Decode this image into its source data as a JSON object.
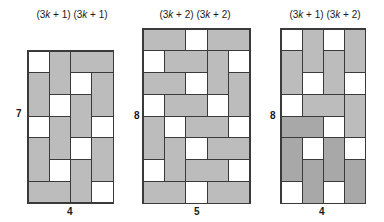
{
  "figures": [
    {
      "id": "fig-a",
      "top_label": "(3k + 1) (3k + 1)",
      "side_label": "7",
      "bottom_label": "4",
      "rows": 7,
      "cols": 4,
      "box": {
        "x": 27,
        "y": 50,
        "w": 87,
        "h": 154
      },
      "label_pos": {
        "top": [
          27,
          9,
          90
        ],
        "side": [
          16,
          108
        ],
        "bottom": [
          67,
          206
        ]
      },
      "tiles": [
        {
          "r": 0,
          "c": 0,
          "rs": 1,
          "cs": 1,
          "fill": "white"
        },
        {
          "r": 0,
          "c": 1,
          "rs": 2,
          "cs": 1,
          "fill": "gray"
        },
        {
          "r": 0,
          "c": 2,
          "rs": 1,
          "cs": 2,
          "fill": "gray"
        },
        {
          "r": 1,
          "c": 0,
          "rs": 2,
          "cs": 1,
          "fill": "gray"
        },
        {
          "r": 1,
          "c": 2,
          "rs": 1,
          "cs": 1,
          "fill": "white"
        },
        {
          "r": 1,
          "c": 3,
          "rs": 2,
          "cs": 1,
          "fill": "gray"
        },
        {
          "r": 2,
          "c": 1,
          "rs": 1,
          "cs": 1,
          "fill": "white"
        },
        {
          "r": 2,
          "c": 2,
          "rs": 2,
          "cs": 1,
          "fill": "gray"
        },
        {
          "r": 3,
          "c": 0,
          "rs": 1,
          "cs": 1,
          "fill": "white"
        },
        {
          "r": 3,
          "c": 1,
          "rs": 2,
          "cs": 1,
          "fill": "gray"
        },
        {
          "r": 3,
          "c": 3,
          "rs": 1,
          "cs": 1,
          "fill": "white"
        },
        {
          "r": 4,
          "c": 0,
          "rs": 2,
          "cs": 1,
          "fill": "gray"
        },
        {
          "r": 4,
          "c": 2,
          "rs": 1,
          "cs": 1,
          "fill": "white"
        },
        {
          "r": 4,
          "c": 3,
          "rs": 2,
          "cs": 1,
          "fill": "gray"
        },
        {
          "r": 5,
          "c": 1,
          "rs": 1,
          "cs": 1,
          "fill": "white"
        },
        {
          "r": 5,
          "c": 2,
          "rs": 2,
          "cs": 1,
          "fill": "gray"
        },
        {
          "r": 6,
          "c": 0,
          "rs": 1,
          "cs": 2,
          "fill": "gray"
        },
        {
          "r": 6,
          "c": 3,
          "rs": 1,
          "cs": 1,
          "fill": "white"
        }
      ]
    },
    {
      "id": "fig-b",
      "top_label": "(3k + 2) (3k + 2)",
      "side_label": "8",
      "bottom_label": "5",
      "rows": 8,
      "cols": 5,
      "box": {
        "x": 142,
        "y": 28,
        "w": 109,
        "h": 176
      },
      "label_pos": {
        "top": [
          150,
          9,
          90
        ],
        "side": [
          134,
          110
        ],
        "bottom": [
          194,
          206
        ]
      },
      "tiles": [
        {
          "r": 0,
          "c": 0,
          "rs": 1,
          "cs": 2,
          "fill": "gray"
        },
        {
          "r": 0,
          "c": 2,
          "rs": 1,
          "cs": 1,
          "fill": "white"
        },
        {
          "r": 0,
          "c": 3,
          "rs": 1,
          "cs": 2,
          "fill": "gray"
        },
        {
          "r": 1,
          "c": 0,
          "rs": 1,
          "cs": 1,
          "fill": "white"
        },
        {
          "r": 1,
          "c": 1,
          "rs": 1,
          "cs": 2,
          "fill": "gray"
        },
        {
          "r": 1,
          "c": 3,
          "rs": 2,
          "cs": 1,
          "fill": "gray"
        },
        {
          "r": 1,
          "c": 4,
          "rs": 1,
          "cs": 1,
          "fill": "white"
        },
        {
          "r": 2,
          "c": 0,
          "rs": 1,
          "cs": 2,
          "fill": "gray"
        },
        {
          "r": 2,
          "c": 2,
          "rs": 1,
          "cs": 1,
          "fill": "white"
        },
        {
          "r": 2,
          "c": 4,
          "rs": 2,
          "cs": 1,
          "fill": "gray"
        },
        {
          "r": 3,
          "c": 0,
          "rs": 1,
          "cs": 1,
          "fill": "white"
        },
        {
          "r": 3,
          "c": 1,
          "rs": 1,
          "cs": 2,
          "fill": "gray"
        },
        {
          "r": 3,
          "c": 3,
          "rs": 1,
          "cs": 1,
          "fill": "white"
        },
        {
          "r": 4,
          "c": 0,
          "rs": 2,
          "cs": 1,
          "fill": "gray"
        },
        {
          "r": 4,
          "c": 1,
          "rs": 1,
          "cs": 1,
          "fill": "white"
        },
        {
          "r": 4,
          "c": 2,
          "rs": 1,
          "cs": 2,
          "fill": "gray"
        },
        {
          "r": 4,
          "c": 4,
          "rs": 1,
          "cs": 1,
          "fill": "white"
        },
        {
          "r": 5,
          "c": 1,
          "rs": 2,
          "cs": 1,
          "fill": "gray"
        },
        {
          "r": 5,
          "c": 2,
          "rs": 1,
          "cs": 1,
          "fill": "white"
        },
        {
          "r": 5,
          "c": 3,
          "rs": 1,
          "cs": 2,
          "fill": "gray"
        },
        {
          "r": 6,
          "c": 0,
          "rs": 1,
          "cs": 1,
          "fill": "white"
        },
        {
          "r": 6,
          "c": 2,
          "rs": 1,
          "cs": 2,
          "fill": "gray"
        },
        {
          "r": 6,
          "c": 4,
          "rs": 1,
          "cs": 1,
          "fill": "white"
        },
        {
          "r": 7,
          "c": 0,
          "rs": 1,
          "cs": 2,
          "fill": "gray"
        },
        {
          "r": 7,
          "c": 2,
          "rs": 1,
          "cs": 1,
          "fill": "white"
        },
        {
          "r": 7,
          "c": 3,
          "rs": 1,
          "cs": 2,
          "fill": "gray"
        }
      ]
    },
    {
      "id": "fig-c",
      "top_label": "(3k + 1) (3k + 2)",
      "side_label": "8",
      "bottom_label": "4",
      "rows": 8,
      "cols": 4,
      "box": {
        "x": 280,
        "y": 28,
        "w": 86,
        "h": 176
      },
      "label_pos": {
        "top": [
          280,
          9,
          90
        ],
        "side": [
          270,
          110
        ],
        "bottom": [
          319,
          206
        ]
      },
      "tiles": [
        {
          "r": 0,
          "c": 0,
          "rs": 1,
          "cs": 1,
          "fill": "white"
        },
        {
          "r": 0,
          "c": 1,
          "rs": 2,
          "cs": 1,
          "fill": "gray"
        },
        {
          "r": 0,
          "c": 2,
          "rs": 1,
          "cs": 1,
          "fill": "white"
        },
        {
          "r": 0,
          "c": 3,
          "rs": 2,
          "cs": 1,
          "fill": "gray"
        },
        {
          "r": 1,
          "c": 0,
          "rs": 2,
          "cs": 1,
          "fill": "gray"
        },
        {
          "r": 1,
          "c": 2,
          "rs": 2,
          "cs": 1,
          "fill": "gray"
        },
        {
          "r": 2,
          "c": 1,
          "rs": 1,
          "cs": 1,
          "fill": "white"
        },
        {
          "r": 2,
          "c": 3,
          "rs": 1,
          "cs": 1,
          "fill": "white"
        },
        {
          "r": 3,
          "c": 0,
          "rs": 1,
          "cs": 1,
          "fill": "white"
        },
        {
          "r": 3,
          "c": 1,
          "rs": 1,
          "cs": 2,
          "fill": "gray"
        },
        {
          "r": 3,
          "c": 3,
          "rs": 2,
          "cs": 1,
          "fill": "gray"
        },
        {
          "r": 4,
          "c": 0,
          "rs": 1,
          "cs": 2,
          "fill": "dark"
        },
        {
          "r": 4,
          "c": 2,
          "rs": 1,
          "cs": 1,
          "fill": "white"
        },
        {
          "r": 5,
          "c": 0,
          "rs": 2,
          "cs": 1,
          "fill": "dark"
        },
        {
          "r": 5,
          "c": 1,
          "rs": 1,
          "cs": 1,
          "fill": "white"
        },
        {
          "r": 5,
          "c": 2,
          "rs": 2,
          "cs": 1,
          "fill": "dark"
        },
        {
          "r": 5,
          "c": 3,
          "rs": 1,
          "cs": 1,
          "fill": "white"
        },
        {
          "r": 6,
          "c": 1,
          "rs": 2,
          "cs": 1,
          "fill": "dark"
        },
        {
          "r": 6,
          "c": 3,
          "rs": 2,
          "cs": 1,
          "fill": "dark"
        },
        {
          "r": 7,
          "c": 0,
          "rs": 1,
          "cs": 1,
          "fill": "white"
        },
        {
          "r": 7,
          "c": 2,
          "rs": 1,
          "cs": 1,
          "fill": "white"
        }
      ]
    }
  ]
}
